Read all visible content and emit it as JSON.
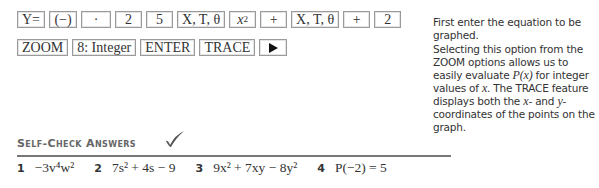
{
  "keystrokes": {
    "row1": [
      {
        "label": "Y="
      },
      {
        "label": "(−)"
      },
      {
        "label": "·"
      },
      {
        "label": "2"
      },
      {
        "label": "5"
      },
      {
        "label": "X, T, θ"
      },
      {
        "label": "x²",
        "base": "x",
        "exp": "2"
      },
      {
        "label": "+"
      },
      {
        "label": "X, T, θ"
      },
      {
        "label": "+"
      },
      {
        "label": "2"
      }
    ],
    "row2": [
      {
        "label": "ZOOM"
      },
      {
        "label": "8: Integer"
      },
      {
        "label": "ENTER"
      },
      {
        "label": "TRACE"
      },
      {
        "label": "▶",
        "icon": "right-arrow-icon"
      }
    ]
  },
  "notes": {
    "note1": "First enter the equation to be graphed.",
    "note2": {
      "part1": "Selecting this option from the ZOOM options allows us to easily evaluate ",
      "px": "P(x)",
      "part2": " for integer values of ",
      "x": "x",
      "part3": ". The TRACE feature displays both the ",
      "x2": "x",
      "part4": "- and ",
      "y": "y",
      "part5": "- coordinates of the points on the graph."
    }
  },
  "self_check": {
    "title": "Self-Check Answers",
    "check_icon": "checkmark-icon",
    "answers": [
      {
        "number": "1",
        "text": "−3v⁴w²"
      },
      {
        "number": "2",
        "text": "7s² + 4s − 9"
      },
      {
        "number": "3",
        "text": "9x² + 7xy − 8y²"
      },
      {
        "number": "4",
        "text": "P(−2) = 5"
      }
    ]
  }
}
